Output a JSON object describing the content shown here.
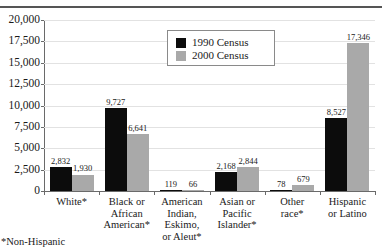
{
  "chart_data": {
    "type": "bar",
    "title": "",
    "xlabel": "",
    "ylabel": "",
    "ylim": [
      0,
      20000
    ],
    "ytick_labels": [
      "20,000",
      "17,500",
      "15,000",
      "12,500",
      "10,000",
      "7,500",
      "5,000",
      "2,500",
      "0"
    ],
    "ytick_values": [
      20000,
      17500,
      15000,
      12500,
      10000,
      7500,
      5000,
      2500,
      0
    ],
    "grid": true,
    "legend_position": "top-center",
    "categories": [
      "White*",
      "Black or African American*",
      "American Indian, Eskimo, or Aleut*",
      "Asian or Pacific Islander*",
      "Other race*",
      "Hispanic or Latino"
    ],
    "category_lines": [
      [
        "White*"
      ],
      [
        "Black or",
        "African",
        "American*"
      ],
      [
        "American",
        "Indian,",
        "Eskimo,",
        "or Aleut*"
      ],
      [
        "Asian or",
        "Pacific",
        "Islander*"
      ],
      [
        "Other",
        "race*"
      ],
      [
        "Hispanic",
        "or Latino"
      ]
    ],
    "series": [
      {
        "name": "1990 Census",
        "color": "#0c0c0c",
        "values": [
          2832,
          9727,
          119,
          2168,
          78,
          8527
        ],
        "labels": [
          "2,832",
          "9,727",
          "119",
          "2,168",
          "78",
          "8,527"
        ]
      },
      {
        "name": "2000 Census",
        "color": "#a9a9a9",
        "values": [
          1930,
          6641,
          66,
          2844,
          679,
          17346
        ],
        "labels": [
          "1,930",
          "6,641",
          "66",
          "2,844",
          "679",
          "17,346"
        ]
      }
    ]
  },
  "legend": {
    "items": [
      {
        "label": "1990 Census",
        "color": "#0c0c0c"
      },
      {
        "label": "2000 Census",
        "color": "#a9a9a9"
      }
    ]
  },
  "footnote": "*Non-Hispanic"
}
